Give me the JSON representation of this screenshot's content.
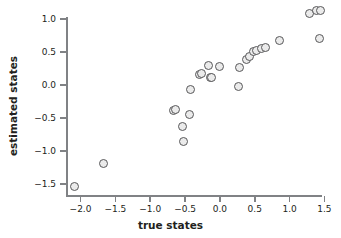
{
  "chart_data": {
    "type": "scatter",
    "title": "",
    "xlabel": "true states",
    "ylabel": "estimated states",
    "xlim": [
      -2.18,
      1.58
    ],
    "ylim": [
      -1.68,
      1.2
    ],
    "xticks": [
      -2.0,
      -1.5,
      -1.0,
      -0.5,
      0.0,
      0.5,
      1.0,
      1.5
    ],
    "xticklabels": [
      "−2.0",
      "−1.5",
      "−1.0",
      "−0.5",
      "0.0",
      "0.5",
      "1.0",
      "1.5"
    ],
    "yticks": [
      1.0,
      0.5,
      0.0,
      -0.5,
      -1.0,
      -1.5
    ],
    "yticklabels": [
      "1.0",
      "0.5",
      "0.0",
      "−0.5",
      "−1.0",
      "−1.5"
    ],
    "grid": false,
    "legend": null,
    "marker": {
      "shape": "circle",
      "face_color": "#ebebeb",
      "edge_color": "#58585a",
      "size_px": 9
    },
    "axis_color": "#808285",
    "text_color": "#231f20",
    "background": "#ffffff",
    "points": [
      {
        "x": -2.08,
        "y": -1.53
      },
      {
        "x": -1.67,
        "y": -1.19
      },
      {
        "x": -0.66,
        "y": -0.38
      },
      {
        "x": -0.64,
        "y": -0.37
      },
      {
        "x": -0.54,
        "y": -0.62
      },
      {
        "x": -0.52,
        "y": -0.86
      },
      {
        "x": -0.43,
        "y": -0.45
      },
      {
        "x": -0.42,
        "y": -0.07
      },
      {
        "x": -0.29,
        "y": 0.16
      },
      {
        "x": -0.26,
        "y": 0.17
      },
      {
        "x": -0.16,
        "y": 0.3
      },
      {
        "x": -0.13,
        "y": 0.12
      },
      {
        "x": -0.12,
        "y": 0.11
      },
      {
        "x": -0.01,
        "y": 0.29
      },
      {
        "x": 0.27,
        "y": -0.02
      },
      {
        "x": 0.28,
        "y": 0.27
      },
      {
        "x": 0.38,
        "y": 0.39
      },
      {
        "x": 0.43,
        "y": 0.44
      },
      {
        "x": 0.48,
        "y": 0.51
      },
      {
        "x": 0.53,
        "y": 0.53
      },
      {
        "x": 0.59,
        "y": 0.56
      },
      {
        "x": 0.66,
        "y": 0.57
      },
      {
        "x": 0.85,
        "y": 0.68
      },
      {
        "x": 1.29,
        "y": 1.09
      },
      {
        "x": 1.38,
        "y": 1.13
      },
      {
        "x": 1.44,
        "y": 1.13
      },
      {
        "x": 1.43,
        "y": 0.71
      }
    ]
  }
}
